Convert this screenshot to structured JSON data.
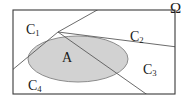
{
  "figure": {
    "type": "set-partition-venn-diagram",
    "universe_label": "Ω",
    "event_label": "A",
    "partition_labels": [
      {
        "base": "C",
        "subscript": "1",
        "text": "C₁",
        "region": "upper-left"
      },
      {
        "base": "C",
        "subscript": "2",
        "text": "C₂",
        "region": "upper-right"
      },
      {
        "base": "C",
        "subscript": "3",
        "text": "C₃",
        "region": "lower-right"
      },
      {
        "base": "C",
        "subscript": "4",
        "text": "C₄",
        "region": "lower-left"
      }
    ],
    "colors": {
      "background": "#ffffff",
      "rectangle_stroke": "#3a3a3a",
      "ellipse_fill": "#d2d2d2",
      "ellipse_stroke": "#8c8c8c",
      "divider_stroke": "#5a5a5a",
      "text": "#1a1a1a"
    },
    "geometry": {
      "rectangle": {
        "x": 13,
        "y": 10,
        "width": 162,
        "height": 84
      },
      "ellipse": {
        "cx": 78,
        "cy": 59,
        "rx": 50,
        "ry": 23
      },
      "vertex": {
        "x": 58,
        "y": 32
      },
      "dividers": [
        {
          "name": "divider-to-top-right",
          "x1": 58,
          "y1": 32,
          "x2": 97,
          "y2": 10
        },
        {
          "name": "divider-to-bottom-left",
          "x1": 58,
          "y1": 32,
          "x2": 13,
          "y2": 69
        },
        {
          "name": "divider-to-right-edge",
          "x1": 58,
          "y1": 32,
          "x2": 175,
          "y2": 47
        },
        {
          "name": "divider-to-bottom-edge",
          "x1": 58,
          "y1": 32,
          "x2": 147,
          "y2": 94
        }
      ]
    },
    "label_positions": {
      "omega": {
        "x": 170,
        "y": 1
      },
      "c1": {
        "x": 26,
        "y": 23
      },
      "c2": {
        "x": 130,
        "y": 30
      },
      "c3": {
        "x": 143,
        "y": 63
      },
      "c4": {
        "x": 28,
        "y": 79
      },
      "a": {
        "x": 62,
        "y": 51
      }
    }
  }
}
